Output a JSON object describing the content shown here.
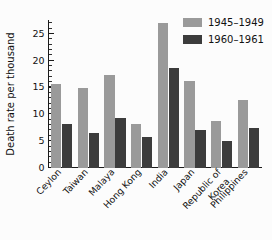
{
  "chart_data": {
    "type": "bar",
    "title": "",
    "subtitle": "",
    "xlabel": "",
    "ylabel": "Death rate per thousand",
    "ylim": [
      0,
      27.5
    ],
    "yticks": [
      0,
      5,
      10,
      15,
      20,
      25
    ],
    "ytick_labels": [
      "0",
      "5",
      "10",
      "15",
      "20",
      "25"
    ],
    "minor_tick_interval": 1,
    "grid": false,
    "legend_position": "top-right",
    "categories": [
      "Ceylon",
      "Taiwan",
      "Malaya",
      "Hong Kong",
      "India",
      "Japan",
      "Republic of\nKorea",
      "Philippines"
    ],
    "series": [
      {
        "name": "1945–1949",
        "color": "#9a9a9a",
        "values": [
          15.6,
          14.8,
          17.2,
          8.2,
          27.0,
          16.2,
          8.7,
          12.5
        ]
      },
      {
        "name": "1960–1961",
        "color": "#3c3c3c",
        "values": [
          8.2,
          6.5,
          9.2,
          5.6,
          18.5,
          7.0,
          5.0,
          7.3
        ]
      }
    ]
  },
  "colors": {
    "series_1945_1949": "#9a9a9a",
    "series_1960_1961": "#3c3c3c",
    "axis": "#1a1a1a",
    "text": "#111111",
    "background": "#fcfcfc"
  },
  "legend": {
    "entries": [
      {
        "label": "1945–1949",
        "color": "#9a9a9a"
      },
      {
        "label": "1960–1961",
        "color": "#3c3c3c"
      }
    ]
  },
  "axes": {
    "y_title": "Death rate per thousand",
    "y_tick_labels": [
      "0",
      "5",
      "10",
      "15",
      "20",
      "25"
    ],
    "x_tick_labels": [
      "Ceylon",
      "Taiwan",
      "Malaya",
      "Hong Kong",
      "India",
      "Japan",
      "Republic of",
      "Korea",
      "Philippines"
    ]
  }
}
